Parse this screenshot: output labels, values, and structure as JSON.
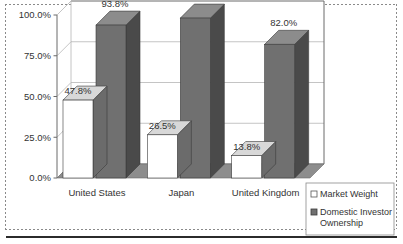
{
  "chart_data": {
    "type": "bar",
    "title": "",
    "xlabel": "",
    "ylabel": "",
    "ylim": [
      0,
      100
    ],
    "grid": true,
    "legend_position": "bottom-right",
    "three_d": true,
    "categories": [
      "United States",
      "Japan",
      "United Kingdom"
    ],
    "y_ticks": [
      "0.0%",
      "25.0%",
      "50.0%",
      "75.0%",
      "100.0%"
    ],
    "y_tick_values": [
      0,
      25,
      50,
      75,
      100
    ],
    "series": [
      {
        "name": "Market Weight",
        "color": "#ffffff",
        "values": [
          47.8,
          26.5,
          13.8
        ],
        "labels": [
          "47.8%",
          "26.5%",
          "13.8%"
        ]
      },
      {
        "name": "Domestic Investor Ownership",
        "color": "#6e6e6e",
        "values": [
          93.8,
          98.1,
          82.0
        ],
        "labels": [
          "93.8%",
          "98.1%",
          "82.0%"
        ]
      }
    ]
  },
  "axis": {
    "ticks": [
      {
        "label": "100.0%",
        "value": 100
      },
      {
        "label": "75.0%",
        "value": 75
      },
      {
        "label": "50.0%",
        "value": 50
      },
      {
        "label": "25.0%",
        "value": 25
      },
      {
        "label": "0.0%",
        "value": 0
      }
    ]
  },
  "categories": [
    {
      "label": "United States"
    },
    {
      "label": "Japan"
    },
    {
      "label": "United Kingdom"
    }
  ],
  "value_labels": [
    {
      "text": "47.8%"
    },
    {
      "text": "93.8%"
    },
    {
      "text": "26.5%"
    },
    {
      "text": "98.1%"
    },
    {
      "text": "13.8%"
    },
    {
      "text": "82.0%"
    }
  ],
  "legend": {
    "items": [
      {
        "label": "Market Weight",
        "swatch": "white-square-icon"
      },
      {
        "label": "Domestic Investor",
        "label2": "Ownership",
        "swatch": "dark-square-icon"
      }
    ]
  },
  "colors": {
    "bar_light_front": "#ffffff",
    "bar_light_side": "#6b6b6b",
    "bar_light_top": "#d8d8d8",
    "bar_dark_front": "#707070",
    "bar_dark_side": "#4a4a4a",
    "bar_dark_top": "#8c8c8c",
    "floor": "#8d8d8d",
    "grid": "#b5b5b5",
    "axis": "#6a6a6a",
    "text": "#333333"
  }
}
